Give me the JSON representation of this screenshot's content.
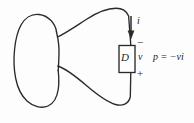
{
  "figure": {
    "stroke_color": "#2a2a2a",
    "background_color": "#fdfdfd"
  },
  "labels": {
    "current": "i",
    "element": "D",
    "voltage": "v",
    "equation": "p = −vi",
    "terminal_top": "−",
    "terminal_bottom": "+"
  },
  "elements": {
    "network_blob": "irregular-closed-network-outline",
    "element_box": "two-terminal-element-box",
    "current_arrow": "downward-current-arrow",
    "top_wire": "curved-top-connecting-wire",
    "bottom_wire": "curved-bottom-connecting-wire"
  }
}
